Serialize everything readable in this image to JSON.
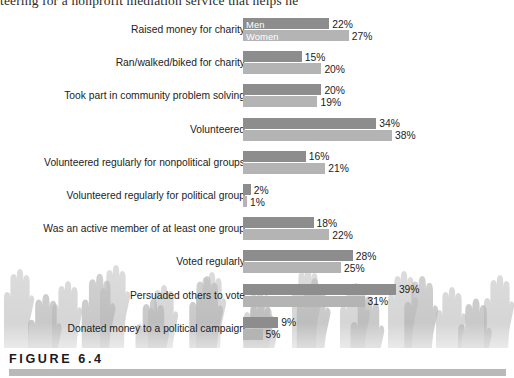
{
  "page": {
    "body_text_fragment": "teering for a nonprofit mediation service that helps he"
  },
  "figure": {
    "caption_label": "FIGURE 6.4"
  },
  "legend": {
    "men": "Men",
    "women": "Women",
    "men_color": "#8d8d8d",
    "women_color": "#b4b4b4"
  },
  "chart_data": {
    "type": "bar",
    "orientation": "horizontal",
    "title": "",
    "subtitle": "",
    "xlabel": "",
    "ylabel": "",
    "grid": false,
    "legend_position": "inside-first-bars",
    "xlim": [
      0,
      40
    ],
    "categories": [
      "Raised money for charity",
      "Ran/walked/biked for charity",
      "Took part in community problem solving",
      "Volunteered",
      "Volunteered regularly for nonpolitical groups",
      "Volunteered regularly for political group",
      "Was an active member of at least one group",
      "Voted regularly",
      "Persuaded others to vote",
      "Donated money to a political campaign"
    ],
    "series": [
      {
        "name": "Men",
        "color": "#8d8d8d",
        "values": [
          22,
          15,
          20,
          34,
          16,
          2,
          18,
          28,
          39,
          9
        ],
        "labels": [
          "22%",
          "15%",
          "20%",
          "34%",
          "16%",
          "2%",
          "18%",
          "28%",
          "39%",
          "9%"
        ]
      },
      {
        "name": "Women",
        "color": "#b4b4b4",
        "values": [
          27,
          20,
          19,
          38,
          21,
          1,
          22,
          25,
          31,
          5
        ],
        "labels": [
          "27%",
          "20%",
          "19%",
          "38%",
          "21%",
          "1%",
          "22%",
          "25%",
          "31%",
          "5%"
        ]
      }
    ]
  }
}
